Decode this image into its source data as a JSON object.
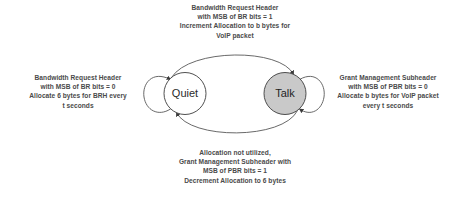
{
  "diagram": {
    "type": "state-transition-diagram",
    "background_color": "#ffffff",
    "stroke_color": "#555555",
    "text_color": "#4a4a4a",
    "states": [
      {
        "id": "quiet",
        "label": "Quiet",
        "fill_color": "#ffffff",
        "stroke_color": "#3c3c3c",
        "cx": 185,
        "cy": 93.5,
        "r": 21
      },
      {
        "id": "talk",
        "label": "Talk",
        "fill_color": "#c9c9c9",
        "stroke_color": "#3c3c3c",
        "cx": 285,
        "cy": 93.5,
        "r": 21
      }
    ],
    "transitions": [
      {
        "id": "quiet-to-talk",
        "from": "quiet",
        "to": "talk",
        "position": "top",
        "label": "Bandwidth Request Header\nwith MSB of BR bits = 1\nIncrement Allocation to b bytes for\nVoIP packet"
      },
      {
        "id": "talk-to-quiet",
        "from": "talk",
        "to": "quiet",
        "position": "bottom",
        "label": "Allocation not utilized,\nGrant Management Subheader with\nMSB of PBR bits = 1\nDecrement Allocation to 6 bytes"
      },
      {
        "id": "quiet-self-loop",
        "from": "quiet",
        "to": "quiet",
        "position": "left",
        "label": "Bandwidth Request Header\nwith MSB of BR bits = 0\nAllocate 6 bytes for BRH every\nt seconds"
      },
      {
        "id": "talk-self-loop",
        "from": "talk",
        "to": "talk",
        "position": "right",
        "label": "Grant Management Subheader\nwith MSB of PBR bits = 0\nAllocate b bytes for VoIP packet\nevery t seconds"
      }
    ]
  }
}
